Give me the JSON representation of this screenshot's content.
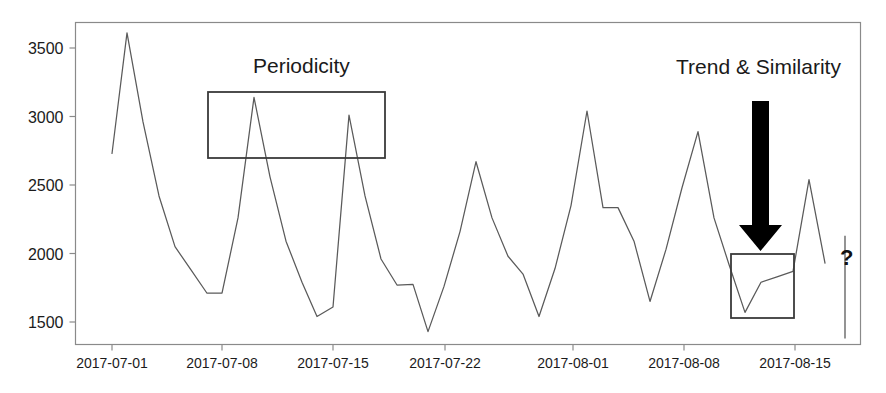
{
  "figure": {
    "background_color": "#ffffff",
    "line_color": "#5a5a5a",
    "frame_color": "#8a8a8a",
    "annotation_color": "#1a1a1a",
    "arrow_color": "#000000"
  },
  "annotations": {
    "periodicity_label": "Periodicity",
    "trend_label": "Trend & Similarity",
    "question_mark": "?",
    "periodicity_box": {
      "x": 208,
      "y": 92,
      "width": 177,
      "height": 66
    },
    "trend_box": {
      "x": 731,
      "y": 254,
      "width": 63,
      "height": 64
    },
    "arrow": {
      "x": 752,
      "y_top": 101,
      "y_tip": 251,
      "shaft_width": 17,
      "head_width": 43
    }
  },
  "chart_data": {
    "type": "line",
    "title": "",
    "xlabel": "",
    "ylabel": "",
    "grid": false,
    "legend": "none",
    "ylim": [
      1350,
      3750
    ],
    "yticks": [
      1500,
      2000,
      2500,
      3000,
      3500
    ],
    "ytick_labels": [
      "1500",
      "2000",
      "2500",
      "3000",
      "3500"
    ],
    "xticks": [
      112,
      222,
      333,
      445,
      573,
      684,
      795
    ],
    "xtick_labels": [
      "2017-07-01",
      "2017-07-08",
      "2017-07-15",
      "2017-07-22",
      "2017-08-01",
      "2017-08-08",
      "2017-08-15"
    ],
    "series": [
      {
        "name": "value",
        "x": [
          112,
          127,
          143,
          159,
          175,
          191,
          207,
          222,
          238,
          254,
          270,
          286,
          302,
          317,
          333,
          349,
          365,
          381,
          397,
          413,
          428,
          444,
          460,
          476,
          492,
          508,
          523,
          539,
          555,
          571,
          587,
          603,
          618,
          634,
          650,
          666,
          682,
          698,
          714,
          729,
          745,
          761,
          777,
          793,
          809,
          825
        ],
        "y": [
          2730,
          3610,
          2960,
          2420,
          2050,
          1880,
          1710,
          1710,
          2260,
          3140,
          2560,
          2090,
          1790,
          1540,
          1610,
          3010,
          2420,
          1960,
          1770,
          1775,
          1430,
          1760,
          2160,
          2670,
          2260,
          1980,
          1850,
          1540,
          1890,
          2350,
          3040,
          2335,
          2335,
          2090,
          1650,
          2030,
          2480,
          2890,
          2260,
          1920,
          1570,
          1790,
          1830,
          1870,
          2540,
          1930
        ]
      }
    ],
    "forecast_marker": {
      "label": "?",
      "x": 845,
      "y_top": 2130,
      "y_bottom": 1380
    }
  }
}
